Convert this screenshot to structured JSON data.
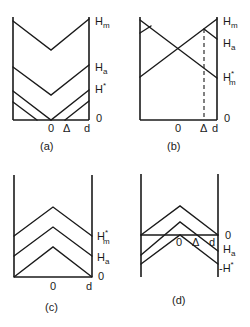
{
  "figure": {
    "panels": [
      {
        "id": "a",
        "caption": "(a)",
        "walls": {
          "left": 13,
          "right": 89,
          "top": 17,
          "base": 120
        },
        "right_labels": [
          {
            "text": "H",
            "sub": "m",
            "sup": "",
            "x": 95,
            "y": 25
          },
          {
            "text": "H",
            "sub": "a",
            "sup": "",
            "x": 95,
            "y": 71
          },
          {
            "text": "H",
            "sub": "",
            "sup": "*",
            "x": 95,
            "y": 93
          },
          {
            "text": "0",
            "sub": "",
            "sup": "",
            "x": 96,
            "y": 122
          }
        ],
        "axis_labels": [
          {
            "text": "0",
            "x": 48,
            "y": 132
          },
          {
            "text": "Δ",
            "x": 63,
            "y": 132
          },
          {
            "text": "d",
            "x": 84,
            "y": 132
          }
        ],
        "lines": [
          [
            [
              13,
              21
            ],
            [
              51,
              50
            ],
            [
              89,
              19
            ]
          ],
          [
            [
              13,
              67
            ],
            [
              51,
              95
            ],
            [
              89,
              65
            ]
          ],
          [
            [
              13,
              91
            ],
            [
              51,
              120
            ],
            [
              89,
              90
            ]
          ],
          [
            [
              13,
              102
            ],
            [
              37,
              120
            ]
          ],
          [
            [
              65,
              120
            ],
            [
              89,
              101
            ]
          ]
        ],
        "dashed": []
      },
      {
        "id": "b",
        "caption": "(b)",
        "walls": {
          "left": 140,
          "right": 217,
          "top": 17,
          "base": 120
        },
        "right_labels": [
          {
            "text": "H",
            "sub": "m",
            "sup": "",
            "x": 223,
            "y": 25
          },
          {
            "text": "H",
            "sub": "a",
            "sup": "",
            "x": 223,
            "y": 47
          },
          {
            "text": "H",
            "sub": "m",
            "sup": "*",
            "x": 223,
            "y": 81
          },
          {
            "text": "0",
            "sub": "",
            "sup": "",
            "x": 224,
            "y": 122
          }
        ],
        "axis_labels": [
          {
            "text": "0",
            "x": 175,
            "y": 132
          },
          {
            "text": "Δ",
            "x": 200,
            "y": 132
          },
          {
            "text": "d",
            "x": 212,
            "y": 132
          }
        ],
        "lines": [
          [
            [
              140,
              20
            ],
            [
              217,
              78
            ]
          ],
          [
            [
              140,
              77
            ],
            [
              217,
              19
            ]
          ],
          [
            [
              140,
              33
            ],
            [
              151,
              26
            ]
          ],
          [
            [
              204,
              29
            ],
            [
              217,
              39
            ]
          ]
        ],
        "dashed": [
          [
            [
              204,
              29
            ],
            [
              204,
              120
            ]
          ]
        ]
      },
      {
        "id": "c",
        "caption": "(c)",
        "walls": {
          "left": 14,
          "right": 92,
          "top": 175,
          "base": 277
        },
        "right_labels": [
          {
            "text": "H",
            "sub": "m",
            "sup": "*",
            "x": 97,
            "y": 240
          },
          {
            "text": "H",
            "sub": "a",
            "sup": "",
            "x": 97,
            "y": 261
          },
          {
            "text": "0",
            "sub": "",
            "sup": "",
            "x": 98,
            "y": 280
          }
        ],
        "axis_labels": [
          {
            "text": "0",
            "x": 50,
            "y": 290
          },
          {
            "text": "d",
            "x": 86,
            "y": 290
          }
        ],
        "lines": [
          [
            [
              14,
              236
            ],
            [
              53,
              207
            ],
            [
              92,
              236
            ]
          ],
          [
            [
              14,
              256
            ],
            [
              53,
              227
            ],
            [
              92,
              256
            ]
          ],
          [
            [
              14,
              277
            ],
            [
              53,
              247
            ],
            [
              92,
              277
            ]
          ]
        ],
        "dashed": []
      },
      {
        "id": "d",
        "caption": "(d)",
        "walls": {
          "left": 141,
          "right": 218,
          "top": 174,
          "base": 277
        },
        "right_labels": [
          {
            "text": "0",
            "sub": "",
            "sup": "",
            "x": 225,
            "y": 239
          },
          {
            "text": "H",
            "sub": "a",
            "sup": "",
            "x": 223,
            "y": 253
          },
          {
            "text": "-H",
            "sub": "",
            "sup": "*",
            "x": 219,
            "y": 272
          }
        ],
        "axis_labels": [
          {
            "text": "0",
            "x": 176,
            "y": 246
          },
          {
            "text": "Δ",
            "x": 192,
            "y": 246
          },
          {
            "text": "d",
            "x": 209,
            "y": 246
          }
        ],
        "lines": [
          [
            [
              141,
              235
            ],
            [
              218,
              235
            ]
          ],
          [
            [
              141,
              235
            ],
            [
              180,
              206
            ],
            [
              218,
              235
            ]
          ],
          [
            [
              141,
              255
            ],
            [
              180,
              222
            ],
            [
              218,
              251
            ]
          ],
          [
            [
              141,
              264
            ],
            [
              180,
              235
            ],
            [
              218,
              264
            ]
          ]
        ],
        "dashed": [],
        "no_base": true
      }
    ],
    "captions": [
      {
        "text": "(a)",
        "x": 40,
        "y": 150
      },
      {
        "text": "(b)",
        "x": 167,
        "y": 150
      },
      {
        "text": "(c)",
        "x": 45,
        "y": 311
      },
      {
        "text": "(d)",
        "x": 172,
        "y": 304
      }
    ]
  }
}
